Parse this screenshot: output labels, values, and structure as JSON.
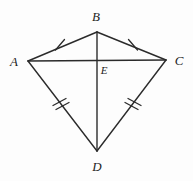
{
  "figure": {
    "type": "geometry-diagram",
    "shape_name": "kite",
    "background_color": "#fdfdfd",
    "stroke_color": "#2b2b2b",
    "label_color": "#1e1e1e",
    "width": 193,
    "height": 181,
    "vertices": [
      {
        "id": "A",
        "label": "A",
        "x": 28,
        "y": 61,
        "label_x": 14,
        "label_y": 61
      },
      {
        "id": "B",
        "label": "B",
        "x": 97,
        "y": 32,
        "label_x": 96,
        "label_y": 16
      },
      {
        "id": "C",
        "label": "C",
        "x": 166,
        "y": 60,
        "label_x": 179,
        "label_y": 60
      },
      {
        "id": "D",
        "label": "D",
        "x": 97,
        "y": 151,
        "label_x": 97,
        "label_y": 166
      },
      {
        "id": "E",
        "label": "E",
        "x": 97,
        "y": 60,
        "label_x": 104,
        "label_y": 70
      }
    ],
    "segments": [
      {
        "id": "AB",
        "from": "A",
        "to": "B",
        "tick_marks": 1
      },
      {
        "id": "BC",
        "from": "B",
        "to": "C",
        "tick_marks": 1
      },
      {
        "id": "AD",
        "from": "A",
        "to": "D",
        "tick_marks": 2
      },
      {
        "id": "CD",
        "from": "C",
        "to": "D",
        "tick_marks": 2
      },
      {
        "id": "AC",
        "from": "A",
        "to": "C",
        "tick_marks": 0
      },
      {
        "id": "BD",
        "from": "B",
        "to": "D",
        "tick_marks": 0
      }
    ],
    "tick_marks": [
      {
        "id": "tick-ab",
        "segment": "AB",
        "count": 1,
        "x": 60,
        "y": 45
      },
      {
        "id": "tick-bc",
        "segment": "BC",
        "count": 1,
        "x": 133,
        "y": 45
      },
      {
        "id": "tick-ad",
        "segment": "AD",
        "count": 2,
        "x": 61,
        "y": 105
      },
      {
        "id": "tick-cd",
        "segment": "CD",
        "count": 2,
        "x": 133,
        "y": 105
      }
    ]
  }
}
